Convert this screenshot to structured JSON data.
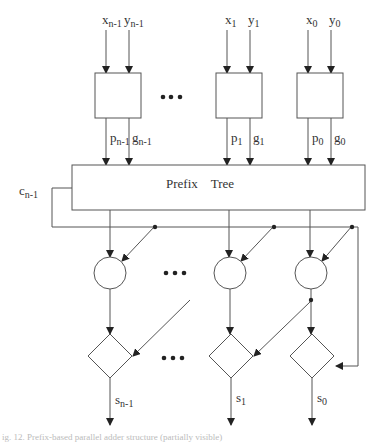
{
  "diagram": {
    "type": "parallel-prefix-adder-block-diagram",
    "inputs": [
      {
        "x": "x",
        "x_sub": "n-1",
        "y": "y",
        "y_sub": "n-1"
      },
      {
        "x": "x",
        "x_sub": "1",
        "y": "y",
        "y_sub": "1"
      },
      {
        "x": "x",
        "x_sub": "0",
        "y": "y",
        "y_sub": "0"
      }
    ],
    "pg_outputs": [
      {
        "p": "p",
        "p_sub": "n-1",
        "g": "g",
        "g_sub": "n-1"
      },
      {
        "p": "p",
        "p_sub": "1",
        "g": "g",
        "g_sub": "1"
      },
      {
        "p": "p",
        "p_sub": "0",
        "g": "g",
        "g_sub": "0"
      }
    ],
    "prefix_tree": {
      "word1": "Prefix",
      "word2": "Tree"
    },
    "carry_out": {
      "c": "c",
      "c_sub": "n-1"
    },
    "sums": [
      {
        "s": "s",
        "s_sub": "n-1"
      },
      {
        "s": "s",
        "s_sub": "1"
      },
      {
        "s": "s",
        "s_sub": "0"
      }
    ],
    "ellipsis": "•••",
    "caption": "ig. 12. Prefix-based parallel adder structure (partially visible)",
    "colors": {
      "stroke": "#555555",
      "fill": "#ffffff",
      "text": "#333333"
    }
  }
}
